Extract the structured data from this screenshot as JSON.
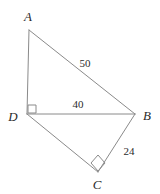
{
  "figure": {
    "type": "geometry-diagram",
    "shape": "quadrilateral-ABCD-with-diagonal-DB",
    "background_color": "#ffffff",
    "stroke_color": "#8a8a8a",
    "text_color": "#2b2b2b",
    "stroke_width": 1,
    "width": 160,
    "height": 194,
    "vertices": [
      {
        "id": "A",
        "label": "A",
        "x": 29,
        "y": 30,
        "label_x": 28,
        "label_y": 16
      },
      {
        "id": "B",
        "label": "B",
        "x": 135,
        "y": 114,
        "label_x": 147,
        "label_y": 115
      },
      {
        "id": "C",
        "label": "C",
        "x": 98,
        "y": 172,
        "label_x": 97,
        "label_y": 184
      },
      {
        "id": "D",
        "label": "D",
        "x": 27,
        "y": 114,
        "label_x": 13,
        "label_y": 116
      }
    ],
    "edges": [
      {
        "id": "AD",
        "from": "A",
        "to": "D",
        "x1": 29,
        "y1": 30,
        "x2": 27,
        "y2": 114
      },
      {
        "id": "AB",
        "from": "A",
        "to": "B",
        "x1": 29,
        "y1": 30,
        "x2": 135,
        "y2": 114
      },
      {
        "id": "DB",
        "from": "D",
        "to": "B",
        "x1": 27,
        "y1": 114,
        "x2": 135,
        "y2": 114
      },
      {
        "id": "DC",
        "from": "D",
        "to": "C",
        "x1": 27,
        "y1": 114,
        "x2": 98,
        "y2": 172
      },
      {
        "id": "BC",
        "from": "B",
        "to": "C",
        "x1": 135,
        "y1": 114,
        "x2": 98,
        "y2": 172
      }
    ],
    "length_labels": [
      {
        "id": "AB",
        "edge": "AB",
        "text": "50",
        "x": 85,
        "y": 63
      },
      {
        "id": "DB",
        "edge": "DB",
        "text": "40",
        "x": 78,
        "y": 104
      },
      {
        "id": "BC",
        "edge": "BC",
        "text": "24",
        "x": 129,
        "y": 151
      }
    ],
    "right_angles": [
      {
        "id": "angle-D",
        "at_vertex": "D",
        "style": "square",
        "points": "28,105 36,105 36,113 28,113"
      },
      {
        "id": "angle-C",
        "at_vertex": "C",
        "style": "diamond",
        "points": "98,155 105,163 98,171 91,163"
      }
    ]
  }
}
